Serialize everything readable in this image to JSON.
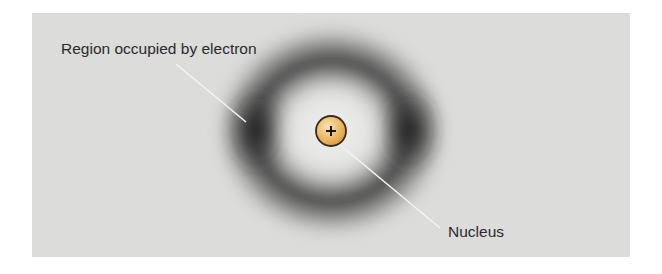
{
  "figure": {
    "background_color": "#dcdcdb",
    "labels": {
      "electron_region": "Region occupied by electron",
      "nucleus": "Nucleus"
    },
    "nucleus": {
      "symbol": "+",
      "fill_light": "#f7dca4",
      "fill_dark": "#e3a446",
      "outline": "#3a2a1a"
    },
    "electron_cloud": {
      "color": "#1e1e1e",
      "shape": "ring"
    },
    "leader_line_color": "#f4f4f2"
  }
}
